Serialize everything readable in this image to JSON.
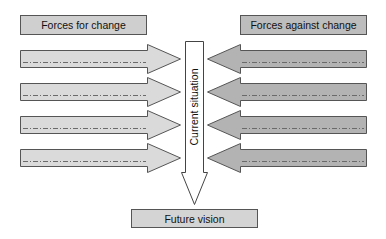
{
  "diagram": {
    "type": "force-field-analysis",
    "header_left": {
      "label": "Forces for change",
      "fill": "#cfcfcf"
    },
    "header_right": {
      "label": "Forces against change",
      "fill": "#bdbdbd"
    },
    "center": {
      "label": "Current situation",
      "fill": "#ffffff"
    },
    "bottom": {
      "label": "Future vision",
      "fill": "#d4d4d4"
    },
    "left_arrows": {
      "count": 4,
      "fill": "#dadada",
      "direction": "right",
      "items": [
        {
          "label": ""
        },
        {
          "label": ""
        },
        {
          "label": ""
        },
        {
          "label": ""
        }
      ]
    },
    "right_arrows": {
      "count": 4,
      "fill": "#b3b3b3",
      "direction": "left",
      "items": [
        {
          "label": ""
        },
        {
          "label": ""
        },
        {
          "label": ""
        },
        {
          "label": ""
        }
      ]
    },
    "colors": {
      "stroke": "#555555",
      "dash": "#6a6a6a",
      "background": "#ffffff"
    }
  }
}
